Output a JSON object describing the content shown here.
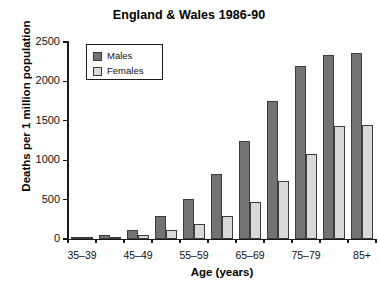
{
  "chart_data": {
    "type": "bar",
    "title": "England & Wales 1986-90",
    "xlabel": "Age (years)",
    "ylabel": "Deaths per 1 million population",
    "categories": [
      "35-39",
      "40-44",
      "45-49",
      "50-54",
      "55-59",
      "60-64",
      "65-69",
      "70-74",
      "75-79",
      "80-84",
      "85+"
    ],
    "tick_labels": [
      "35–39",
      "",
      "45–49",
      "",
      "55–59",
      "",
      "65–69",
      "",
      "75–79",
      "",
      "85+"
    ],
    "series": [
      {
        "name": "Males",
        "color": "#737373",
        "values": [
          15,
          45,
          110,
          290,
          510,
          820,
          1250,
          1750,
          2200,
          2330,
          2360
        ]
      },
      {
        "name": "Females",
        "color": "#d9d9d9",
        "values": [
          10,
          25,
          55,
          120,
          190,
          295,
          465,
          730,
          1075,
          1430,
          1450
        ]
      }
    ],
    "ylim": [
      0,
      2500
    ],
    "yticks": [
      0,
      500,
      1000,
      1500,
      2000,
      2500
    ],
    "ytick_labels": [
      "0",
      "500",
      "1000",
      "1500",
      "2000",
      "2500"
    ],
    "grid": false,
    "legend_position": "top-left",
    "legend_entries": [
      "Males",
      "Females"
    ]
  }
}
